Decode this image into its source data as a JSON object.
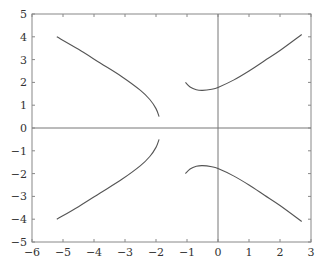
{
  "chart_data": {
    "type": "line",
    "title": "",
    "xlabel": "",
    "ylabel": "",
    "xlim": [
      -6,
      3
    ],
    "ylim": [
      -5,
      5
    ],
    "xticks": [
      -6,
      -5,
      -4,
      -3,
      -2,
      -1,
      0,
      1,
      2,
      3
    ],
    "yticks": [
      -5,
      -4,
      -3,
      -2,
      -1,
      0,
      1,
      2,
      3,
      4,
      5
    ],
    "xtick_labels": [
      "−6",
      "−5",
      "−4",
      "−3",
      "−2",
      "−1",
      "0",
      "1",
      "2",
      "3"
    ],
    "ytick_labels": [
      "−5",
      "−4",
      "−3",
      "−2",
      "−1",
      "0",
      "1",
      "2",
      "3",
      "4",
      "5"
    ],
    "grid": false,
    "legend": null,
    "reference_lines": [
      {
        "axis": "x",
        "value": 0
      },
      {
        "axis": "y",
        "value": 0
      }
    ],
    "color": "#555555",
    "series": [
      {
        "name": "left-upper-branch",
        "x": [
          -5.2,
          -4.5,
          -3.8,
          -3.1,
          -2.5,
          -2.2,
          -2.0,
          -1.9
        ],
        "y": [
          4.0,
          3.45,
          2.85,
          2.25,
          1.65,
          1.25,
          0.85,
          0.5
        ]
      },
      {
        "name": "left-lower-branch",
        "x": [
          -5.2,
          -4.5,
          -3.8,
          -3.1,
          -2.5,
          -2.2,
          -2.0,
          -1.9
        ],
        "y": [
          -4.0,
          -3.45,
          -2.85,
          -2.25,
          -1.65,
          -1.25,
          -0.85,
          -0.5
        ]
      },
      {
        "name": "right-upper-branch",
        "x": [
          -1.05,
          -0.9,
          -0.7,
          -0.5,
          -0.2,
          0.0,
          0.5,
          1.0,
          1.5,
          2.0,
          2.7
        ],
        "y": [
          2.0,
          1.8,
          1.68,
          1.65,
          1.7,
          1.78,
          2.1,
          2.5,
          2.95,
          3.4,
          4.1
        ]
      },
      {
        "name": "right-lower-branch",
        "x": [
          -1.05,
          -0.9,
          -0.7,
          -0.5,
          -0.2,
          0.0,
          0.5,
          1.0,
          1.5,
          2.0,
          2.7
        ],
        "y": [
          -2.0,
          -1.8,
          -1.68,
          -1.65,
          -1.7,
          -1.78,
          -2.1,
          -2.5,
          -2.95,
          -3.4,
          -4.1
        ]
      }
    ]
  },
  "frame": {
    "left": 32,
    "right": 311,
    "top": 14,
    "bottom": 242
  }
}
